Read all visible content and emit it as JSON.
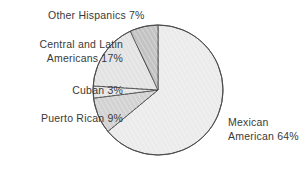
{
  "chart_data": {
    "type": "pie",
    "title": "",
    "subtitle": "",
    "xlabel": "",
    "ylabel": "",
    "legend_position": "none",
    "grid": false,
    "units": "percent",
    "total": 100,
    "categories": [
      "Mexican American",
      "Other Hispanics",
      "Central and Latin Americans",
      "Cuban",
      "Puerto Rican"
    ],
    "values": [
      64,
      7,
      17,
      3,
      9
    ],
    "slices": [
      {
        "name": "Mexican American",
        "value": 64,
        "label_line1": "Mexican",
        "label_line2": "American 64%",
        "fill": "#ebebeb",
        "stroke": "#4a4a4a"
      },
      {
        "name": "Other Hispanics",
        "value": 7,
        "label_line1": "Other Hispanics 7%",
        "label_line2": "",
        "fill": "#c3c3c3",
        "stroke": "#4a4a4a"
      },
      {
        "name": "Central and Latin Americans",
        "value": 17,
        "label_line1": "Central and Latin",
        "label_line2": "Americans 17%",
        "fill": "#e3e3e3",
        "stroke": "#4a4a4a"
      },
      {
        "name": "Cuban",
        "value": 3,
        "label_line1": "Cuban 3%",
        "label_line2": "",
        "fill": "#e6e6e6",
        "stroke": "#4a4a4a"
      },
      {
        "name": "Puerto Rican",
        "value": 9,
        "label_line1": "Puerto Rican 9%",
        "label_line2": "",
        "fill": "#d2d2d2",
        "stroke": "#4a4a4a"
      }
    ],
    "annotations": [
      "Other Hispanics 7%",
      "Central and Latin Americans 17%",
      "Cuban 3%",
      "Puerto Rican 9%",
      "Mexican American 64%"
    ]
  },
  "figure": {
    "background": "#ffffff",
    "text_color": "#3a3a3a",
    "outline_color": "#4a4a4a"
  }
}
